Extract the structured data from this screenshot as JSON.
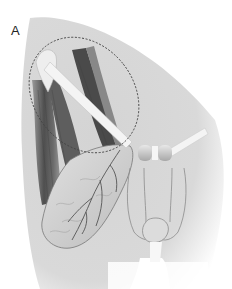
{
  "figure": {
    "panel_label": "A",
    "elements": [
      {
        "name": "skin-background",
        "description": "grey shaded body silhouette"
      },
      {
        "name": "highlight-ellipse",
        "description": "dashed ellipse around upper thigh / inguinal region"
      },
      {
        "name": "thigh-muscles",
        "description": "dark striated muscle bundles on left"
      },
      {
        "name": "muscle-flap",
        "description": "lobulated flap with branching vessels"
      },
      {
        "name": "tension-band",
        "description": "pale strap crossing diagonally to midline"
      },
      {
        "name": "midline-connectors",
        "description": "paired rounded blocks at midline"
      },
      {
        "name": "genitalia-outline",
        "description": "line drawing of external genitalia"
      }
    ]
  },
  "colors": {
    "background": "#ffffff",
    "skin": "#d6d6d6",
    "skin_light": "#e6e6e6",
    "muscle_dark": "#5a5a5a",
    "muscle_mid": "#8a8a8a",
    "flap": "#cfcfcf",
    "vessel": "#555555",
    "band": "#f2f2f2",
    "outline": "#8c8c8c",
    "dash": "#444444"
  }
}
